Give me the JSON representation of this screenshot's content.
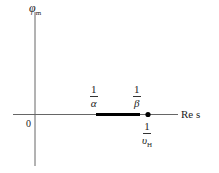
{
  "diagram": {
    "y_axis": {
      "label": "φ",
      "label_sub": "m"
    },
    "x_axis": {
      "label": "Re s"
    },
    "origin_label": "0",
    "markers": [
      {
        "id": "alpha",
        "numerator": "1",
        "denominator": "α"
      },
      {
        "id": "beta",
        "numerator": "1",
        "denominator": "β"
      },
      {
        "id": "vh",
        "numerator": "1",
        "denominator": "υ",
        "denominator_sub": "H"
      }
    ],
    "segment": {
      "from": "1/α",
      "to": "1/β",
      "style": "thick"
    },
    "point": {
      "at": "1/υ_H",
      "style": "filled-dot"
    },
    "colors": {
      "axis": "#555555",
      "segment": "#000000",
      "text": "#222222"
    }
  }
}
